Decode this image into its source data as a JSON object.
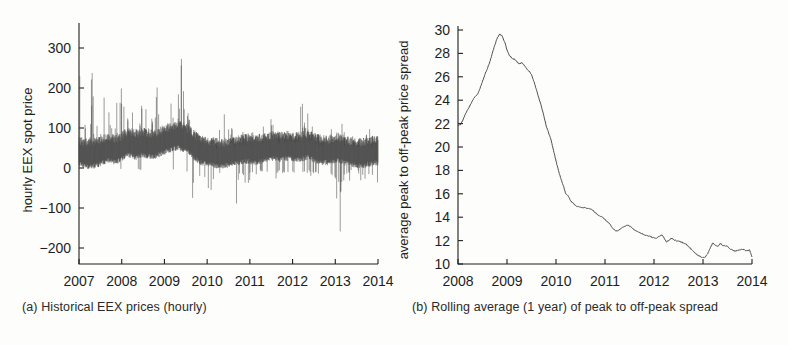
{
  "figure": {
    "type": "multi-panel-figure",
    "panel_count": 2
  },
  "panel_a": {
    "caption": "(a) Historical EEX prices (hourly)",
    "chart_data": {
      "type": "line",
      "title": "",
      "xlabel": "",
      "ylabel": "hourly EEX spot price",
      "xlim": [
        2007.0,
        2014.0
      ],
      "ylim": [
        -240,
        350
      ],
      "grid": false,
      "legend": "none",
      "xticks": [
        2007,
        2008,
        2009,
        2010,
        2011,
        2012,
        2013,
        2014
      ],
      "xticklabels": [
        "2007",
        "2008",
        "2009",
        "2010",
        "2011",
        "2012",
        "2013",
        "2014"
      ],
      "yticks": [
        -200,
        -100,
        0,
        100,
        200,
        300
      ],
      "yticklabels": [
        "-200",
        "-100",
        "0",
        "100",
        "200",
        "300"
      ],
      "description": "Dense hourly EEX spot price series, 2007-2014. Baseline band roughly 20-70 EUR/MWh with frequent upward price spikes (strongest 2007-2008 exceeding 300) and sporadic negative price spikes reaching below -200 around late 2009 and end of 2012.",
      "x": [
        2007.0,
        2007.05,
        2007.1,
        2007.15,
        2007.2,
        2007.25,
        2007.3,
        2007.35,
        2007.4,
        2007.45,
        2007.5,
        2007.55,
        2007.6,
        2007.65,
        2007.7,
        2007.75,
        2007.8,
        2007.85,
        2007.9,
        2007.95,
        2008.0,
        2008.05,
        2008.1,
        2008.15,
        2008.2,
        2008.25,
        2008.3,
        2008.35,
        2008.4,
        2008.45,
        2008.5,
        2008.55,
        2008.6,
        2008.65,
        2008.7,
        2008.75,
        2008.8,
        2008.85,
        2008.9,
        2008.95,
        2009.0,
        2009.1,
        2009.2,
        2009.3,
        2009.4,
        2009.5,
        2009.6,
        2009.7,
        2009.8,
        2009.9,
        2010.0,
        2010.1,
        2010.2,
        2010.3,
        2010.4,
        2010.5,
        2010.6,
        2010.7,
        2010.8,
        2010.9,
        2011.0,
        2011.1,
        2011.2,
        2011.3,
        2011.4,
        2011.5,
        2011.6,
        2011.7,
        2011.8,
        2011.9,
        2012.0,
        2012.1,
        2012.2,
        2012.3,
        2012.4,
        2012.5,
        2012.6,
        2012.7,
        2012.8,
        2012.9,
        2013.0,
        2013.1,
        2013.2,
        2013.3,
        2013.4,
        2013.5,
        2013.6,
        2013.7,
        2013.8,
        2013.9,
        2014.0
      ],
      "baseline_mean": [
        38,
        36,
        34,
        33,
        35,
        36,
        38,
        42,
        45,
        48,
        46,
        44,
        47,
        52,
        58,
        62,
        60,
        55,
        58,
        62,
        60,
        58,
        56,
        58,
        62,
        66,
        70,
        72,
        75,
        78,
        80,
        76,
        72,
        68,
        60,
        52,
        46,
        42,
        40,
        38,
        36,
        35,
        34,
        33,
        35,
        36,
        38,
        40,
        42,
        44,
        45,
        46,
        44,
        43,
        45,
        46,
        48,
        50,
        52,
        54,
        52,
        50,
        52,
        54,
        52,
        50,
        51,
        52,
        53,
        55,
        52,
        48,
        46,
        44,
        43,
        42,
        44,
        46,
        48,
        46,
        42,
        40,
        38,
        37,
        36,
        35,
        36,
        38,
        40,
        42,
        40
      ],
      "max_spikes": [
        300,
        120,
        110,
        150,
        330,
        140,
        130,
        300,
        160,
        140,
        120,
        130,
        350,
        340,
        200,
        180,
        160,
        150,
        170,
        160,
        150,
        180,
        220,
        200,
        250,
        300,
        280,
        230,
        200,
        190,
        260,
        300,
        350,
        180,
        160,
        140,
        120,
        110,
        100,
        95,
        90,
        85,
        110,
        95,
        200,
        180,
        110,
        100,
        95,
        100,
        110,
        95,
        90,
        100,
        130,
        110,
        100,
        140,
        120,
        110,
        100,
        95,
        110,
        120,
        100,
        95,
        110,
        190,
        200,
        130,
        110,
        100,
        95,
        100,
        110,
        130,
        120,
        110,
        140,
        130,
        100,
        95,
        90,
        95,
        100,
        95,
        110,
        120,
        100,
        95,
        90
      ],
      "min_spikes": [
        0,
        0,
        -5,
        0,
        0,
        -10,
        0,
        0,
        0,
        -5,
        0,
        0,
        0,
        -20,
        -10,
        0,
        0,
        0,
        -15,
        -10,
        0,
        0,
        -5,
        0,
        0,
        -10,
        0,
        0,
        -20,
        0,
        0,
        -30,
        -40,
        -60,
        -100,
        -80,
        -50,
        -40,
        -100,
        -145,
        -60,
        -50,
        -40,
        -90,
        -100,
        -200,
        -230,
        -150,
        -100,
        -60,
        -50,
        -40,
        -30,
        -25,
        -20,
        -30,
        -40,
        -50,
        -100,
        -60,
        -40,
        -30,
        -25,
        -30,
        -40,
        -30,
        -25,
        -30,
        -40,
        -35,
        -30,
        -25,
        -20,
        -25,
        -30,
        -40,
        -50,
        -60,
        -100,
        -220,
        -70,
        -40,
        -30,
        -25,
        -30,
        -35,
        -40,
        -50,
        -100,
        -60,
        -40
      ]
    }
  },
  "panel_b": {
    "caption": "(b) Rolling average (1 year) of peak to off-peak spread",
    "chart_data": {
      "type": "line",
      "title": "",
      "xlabel": "",
      "ylabel": "average peak to off-peak price spread",
      "xlim": [
        2008.0,
        2014.0
      ],
      "ylim": [
        10,
        30
      ],
      "grid": false,
      "legend": "none",
      "xticks": [
        2008,
        2009,
        2010,
        2011,
        2012,
        2013,
        2014
      ],
      "xticklabels": [
        "2008",
        "2009",
        "2010",
        "2011",
        "2012",
        "2013",
        "2014"
      ],
      "yticks": [
        10,
        12,
        14,
        16,
        18,
        20,
        22,
        24,
        26,
        28,
        30
      ],
      "yticklabels": [
        "10",
        "12",
        "14",
        "16",
        "18",
        "20",
        "22",
        "24",
        "26",
        "28",
        "30"
      ],
      "description": "One-year rolling average of the peak to off-peak price spread. Starts at 21.8 in early 2008, rises to a peak of about 29.7 in late 2008, declines sharply through 2009-2010 to about 14.8, then drifts slowly down to roughly 11 by 2014.",
      "x": [
        2008.0,
        2008.05,
        2008.1,
        2008.15,
        2008.2,
        2008.25,
        2008.3,
        2008.35,
        2008.4,
        2008.45,
        2008.5,
        2008.55,
        2008.6,
        2008.65,
        2008.7,
        2008.75,
        2008.8,
        2008.85,
        2008.9,
        2008.95,
        2009.0,
        2009.05,
        2009.1,
        2009.15,
        2009.2,
        2009.25,
        2009.3,
        2009.35,
        2009.4,
        2009.45,
        2009.5,
        2009.55,
        2009.6,
        2009.65,
        2009.7,
        2009.75,
        2009.8,
        2009.85,
        2009.9,
        2009.95,
        2010.0,
        2010.05,
        2010.1,
        2010.15,
        2010.2,
        2010.25,
        2010.3,
        2010.35,
        2010.4,
        2010.45,
        2010.5,
        2010.55,
        2010.6,
        2010.65,
        2010.7,
        2010.75,
        2010.8,
        2010.85,
        2010.9,
        2010.95,
        2011.0,
        2011.05,
        2011.1,
        2011.15,
        2011.2,
        2011.25,
        2011.3,
        2011.35,
        2011.4,
        2011.45,
        2011.5,
        2011.55,
        2011.6,
        2011.65,
        2011.7,
        2011.75,
        2011.8,
        2011.85,
        2011.9,
        2011.95,
        2012.0,
        2012.05,
        2012.1,
        2012.15,
        2012.2,
        2012.25,
        2012.3,
        2012.35,
        2012.4,
        2012.45,
        2012.5,
        2012.55,
        2012.6,
        2012.65,
        2012.7,
        2012.75,
        2012.8,
        2012.85,
        2012.9,
        2012.95,
        2013.0,
        2013.05,
        2013.1,
        2013.15,
        2013.2,
        2013.25,
        2013.3,
        2013.35,
        2013.4,
        2013.45,
        2013.5,
        2013.55,
        2013.6,
        2013.65,
        2013.7,
        2013.75,
        2013.8,
        2013.85,
        2013.9,
        2013.95,
        2014.0
      ],
      "values": [
        21.8,
        21.9,
        22.3,
        22.8,
        23.2,
        23.6,
        24.0,
        24.3,
        24.5,
        25.0,
        25.6,
        26.2,
        26.7,
        27.3,
        28.0,
        28.7,
        29.3,
        29.65,
        29.5,
        29.0,
        28.3,
        27.8,
        27.6,
        27.5,
        27.3,
        27.1,
        27.2,
        27.0,
        26.7,
        26.5,
        26.2,
        25.6,
        24.9,
        24.2,
        23.5,
        22.7,
        21.8,
        21.2,
        20.6,
        19.7,
        18.8,
        18.0,
        17.3,
        16.7,
        16.0,
        15.8,
        15.4,
        15.2,
        15.0,
        14.9,
        14.85,
        14.8,
        14.8,
        14.75,
        14.7,
        14.6,
        14.4,
        14.2,
        14.1,
        14.0,
        13.8,
        13.6,
        13.4,
        13.1,
        12.9,
        12.8,
        12.95,
        13.1,
        13.2,
        13.3,
        13.25,
        13.1,
        12.9,
        12.8,
        12.7,
        12.6,
        12.5,
        12.45,
        12.4,
        12.3,
        12.25,
        12.2,
        12.35,
        12.5,
        12.3,
        11.9,
        12.0,
        12.2,
        12.1,
        12.0,
        11.95,
        11.9,
        11.8,
        11.7,
        11.5,
        11.3,
        11.1,
        10.9,
        10.75,
        10.6,
        10.55,
        10.6,
        10.9,
        11.4,
        11.8,
        11.6,
        11.5,
        11.75,
        11.6,
        11.55,
        11.5,
        11.3,
        11.2,
        11.1,
        11.15,
        11.2,
        11.25,
        11.2,
        11.15,
        11.2,
        10.6
      ]
    }
  }
}
